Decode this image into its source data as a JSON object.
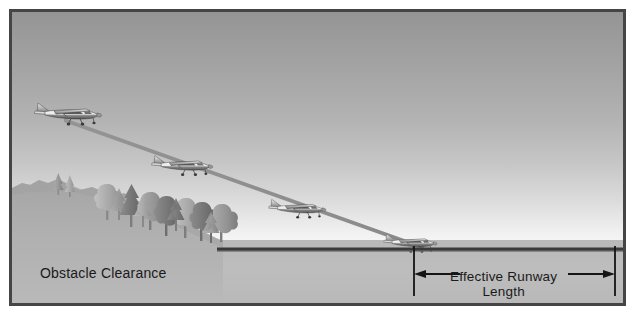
{
  "figure": {
    "type": "aviation-diagram",
    "background_color": "#bdbdbd",
    "border_color": "#454545"
  },
  "labels": {
    "obstacle_clearance": "Obstacle Clearance",
    "effective_runway_line1": "Effective Runway",
    "effective_runway_line2": "Length"
  },
  "scene": {
    "sky": {
      "name": "sky-gradient",
      "top_color": "#949494",
      "horizon_color": "#fafafa"
    },
    "ground": {
      "name": "ground",
      "color": "#bdbdbd",
      "horizon_y": 228
    },
    "hill": {
      "name": "obstacle-hill",
      "color": "#aaaaaa",
      "description": "sloping terrain descending left to right toward the runway threshold"
    },
    "trees": {
      "name": "tree-line",
      "count": 11,
      "description": "cluster of conifers and broadleaf trees along the hill ridge forming the obstacle"
    },
    "runway": {
      "name": "runway",
      "color": "#3a3a3a",
      "start_x": 211,
      "end_x": 612,
      "y": 239
    },
    "glide_slope": {
      "name": "glide-slope-path",
      "color": "#8e8e8e",
      "start": [
        52,
        108
      ],
      "end": [
        412,
        238
      ]
    },
    "aircraft": [
      {
        "name": "aircraft-1",
        "position": [
          54,
          105
        ],
        "scale": 1.0
      },
      {
        "name": "aircraft-2",
        "position": [
          168,
          157
        ],
        "scale": 0.92
      },
      {
        "name": "aircraft-3",
        "position": [
          286,
          200
        ],
        "scale": 0.86
      },
      {
        "name": "aircraft-4",
        "position": [
          400,
          234
        ],
        "scale": 0.8
      }
    ],
    "dimension": {
      "name": "effective-runway-dimension",
      "left_tick_x": 411,
      "right_tick_x": 612,
      "arrow_y": 268,
      "color": "#141414"
    }
  }
}
